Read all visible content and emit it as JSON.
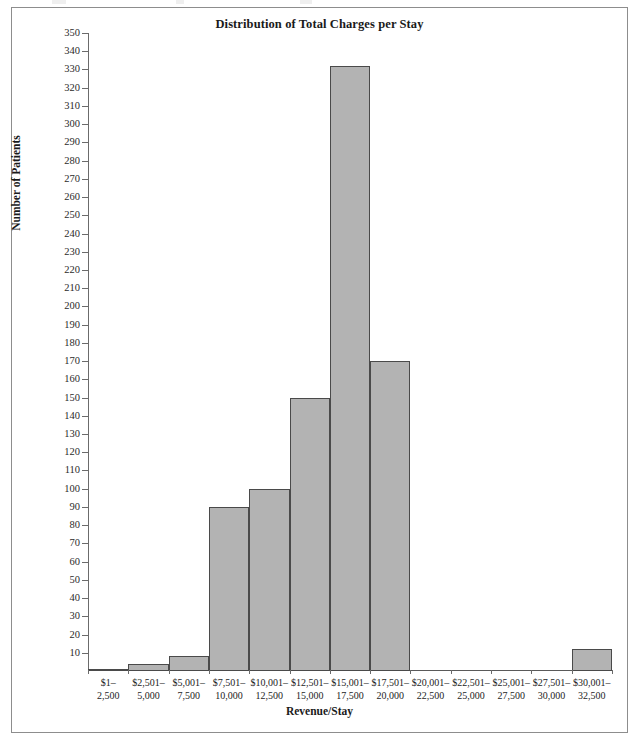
{
  "figure": {
    "title": "Distribution of Total Charges per Stay",
    "x_axis_title": "Revenue/Stay",
    "y_axis_title": "Number of Patients",
    "bar_fill_color": "#b3b3b3",
    "bar_border_color": "#4a4a4a",
    "frame_border_color": "#8d8d8d"
  },
  "chart_data": {
    "type": "bar",
    "title": "Distribution of Total Charges per Stay",
    "xlabel": "Revenue/Stay",
    "ylabel": "Number of Patients",
    "ylim": [
      0,
      350
    ],
    "grid": false,
    "legend": null,
    "categories": [
      "$1–2,500",
      "$2,501–5,000",
      "$5,001–7,500",
      "$7,501–10,000",
      "$10,001–12,500",
      "$12,501–15,000",
      "$15,001–17,500",
      "$17,501–20,000",
      "$20,001–22,500",
      "$22,501–25,000",
      "$25,001–27,500",
      "$27,501–30,000",
      "$30,001–32,500"
    ],
    "values": [
      1,
      4,
      8,
      90,
      100,
      150,
      332,
      170,
      0,
      0,
      0,
      0,
      12
    ],
    "y_ticks": [
      10,
      20,
      30,
      40,
      50,
      60,
      70,
      80,
      90,
      100,
      110,
      120,
      130,
      140,
      150,
      160,
      170,
      180,
      190,
      200,
      210,
      220,
      230,
      240,
      250,
      260,
      270,
      280,
      290,
      300,
      310,
      320,
      330,
      340,
      350
    ]
  },
  "x_category_lines": [
    {
      "line1": "$1–",
      "line2": "2,500"
    },
    {
      "line1": "$2,501–",
      "line2": "5,000"
    },
    {
      "line1": "$5,001–",
      "line2": "7,500"
    },
    {
      "line1": "$7,501–",
      "line2": "10,000"
    },
    {
      "line1": "$10,001–",
      "line2": "12,500"
    },
    {
      "line1": "$12,501–",
      "line2": "15,000"
    },
    {
      "line1": "$15,001–",
      "line2": "17,500"
    },
    {
      "line1": "$17,501–",
      "line2": "20,000"
    },
    {
      "line1": "$20,001–",
      "line2": "22,500"
    },
    {
      "line1": "$22,501–",
      "line2": "25,000"
    },
    {
      "line1": "$25,001–",
      "line2": "27,500"
    },
    {
      "line1": "$27,501–",
      "line2": "30,000"
    },
    {
      "line1": "$30,001–",
      "line2": "32,500"
    }
  ]
}
